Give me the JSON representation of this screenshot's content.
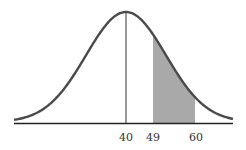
{
  "chart_data": {
    "type": "area",
    "title": "",
    "xlabel": "",
    "ylabel": "",
    "mean": 40,
    "tick_labels": [
      "40",
      "49",
      "60"
    ],
    "shaded_region": {
      "from": 49,
      "to": 60
    },
    "grid": false,
    "legend": null
  },
  "colors": {
    "curve": "#4a4a4a",
    "shade": "#a9a9a9",
    "axis": "#222222"
  },
  "ticks": {
    "t0": "40",
    "t1": "49",
    "t2": "60"
  }
}
